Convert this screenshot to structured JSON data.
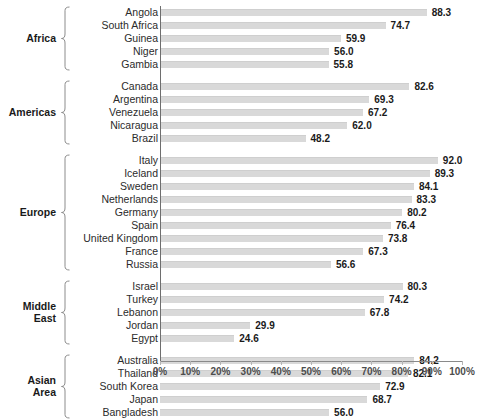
{
  "chart_data": {
    "type": "bar",
    "orientation": "horizontal",
    "title": "",
    "xlabel": "",
    "ylabel": "",
    "xlim": [
      0,
      100
    ],
    "grid": false,
    "legend": null,
    "bar_color": "#d9d9d9",
    "xticks": [
      "0%",
      "10%",
      "20%",
      "30%",
      "40%",
      "50%",
      "60%",
      "70%",
      "80%",
      "90%",
      "100%"
    ],
    "xtick_values": [
      0,
      10,
      20,
      30,
      40,
      50,
      60,
      70,
      80,
      90,
      100
    ],
    "groups": [
      {
        "label": "Africa",
        "categories": [
          "Angola",
          "South Africa",
          "Guinea",
          "Niger",
          "Gambia"
        ],
        "values": [
          88.3,
          74.7,
          59.9,
          56.0,
          55.8
        ],
        "value_labels": [
          "88.3",
          "74.7",
          "59.9",
          "56.0",
          "55.8"
        ]
      },
      {
        "label": "Americas",
        "categories": [
          "Canada",
          "Argentina",
          "Venezuela",
          "Nicaragua",
          "Brazil"
        ],
        "values": [
          82.6,
          69.3,
          67.2,
          62.0,
          48.2
        ],
        "value_labels": [
          "82.6",
          "69.3",
          "67.2",
          "62.0",
          "48.2"
        ]
      },
      {
        "label": "Europe",
        "categories": [
          "Italy",
          "Iceland",
          "Sweden",
          "Netherlands",
          "Germany",
          "Spain",
          "United Kingdom",
          "France",
          "Russia"
        ],
        "values": [
          92.0,
          89.3,
          84.1,
          83.3,
          80.2,
          76.4,
          73.8,
          67.3,
          56.6
        ],
        "value_labels": [
          "92.0",
          "89.3",
          "84.1",
          "83.3",
          "80.2",
          "76.4",
          "73.8",
          "67.3",
          "56.6"
        ]
      },
      {
        "label": "Middle\nEast",
        "label_lines": [
          "Middle",
          "East"
        ],
        "categories": [
          "Israel",
          "Turkey",
          "Lebanon",
          "Jordan",
          "Egypt"
        ],
        "values": [
          80.3,
          74.2,
          67.8,
          29.9,
          24.6
        ],
        "value_labels": [
          "80.3",
          "74.2",
          "67.8",
          "29.9",
          "24.6"
        ]
      },
      {
        "label": "Asian\nArea",
        "label_lines": [
          "Asian",
          "Area"
        ],
        "categories": [
          "Australia",
          "Thailand",
          "South Korea",
          "Japan",
          "Bangladesh"
        ],
        "values": [
          84.2,
          82.1,
          72.9,
          68.7,
          56.0
        ],
        "value_labels": [
          "84.2",
          "82.1",
          "72.9",
          "68.7",
          "56.0"
        ]
      }
    ]
  }
}
